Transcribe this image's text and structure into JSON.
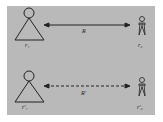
{
  "diagram": {
    "top_row": {
      "left_label": "r₁",
      "right_label": "r₂",
      "relation_label": "R",
      "line_style": "solid"
    },
    "bottom_row": {
      "left_label": "r'₁",
      "right_label": "r'₂",
      "relation_label": "R'",
      "line_style": "dashed"
    },
    "colors": {
      "background": "#b9b9b9",
      "stroke": "#222222"
    }
  }
}
